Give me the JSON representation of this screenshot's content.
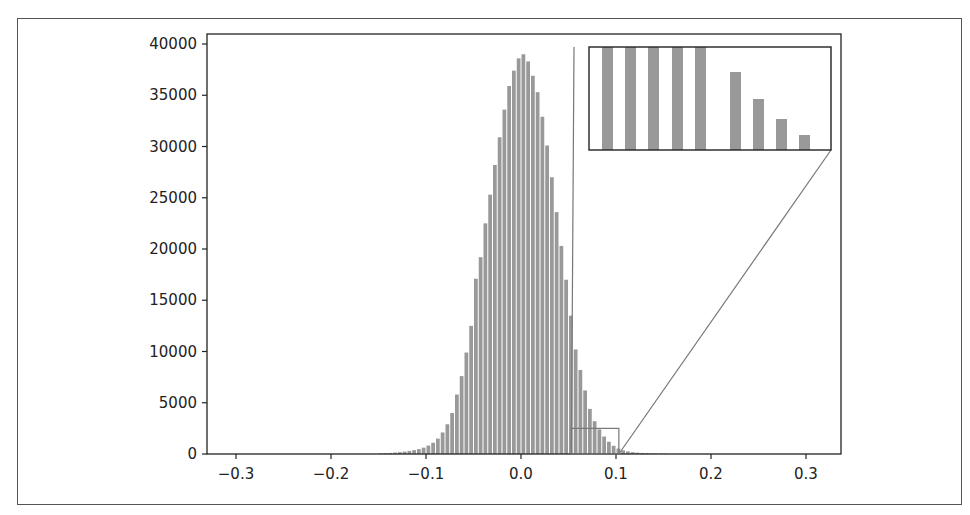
{
  "chart_data": {
    "type": "bar",
    "title": "",
    "xlabel": "",
    "ylabel": "",
    "xlim": [
      -0.33,
      0.335
    ],
    "ylim": [
      0,
      41000
    ],
    "grid": false,
    "legend": null,
    "bin_width": 0.005,
    "bar_color": "#999999",
    "x_ticks": [
      -0.3,
      -0.2,
      -0.1,
      0.0,
      0.1,
      0.2,
      0.3
    ],
    "x_tick_labels": [
      "-0.3",
      "-0.2",
      "-0.1",
      "0.0",
      "0.1",
      "0.2",
      "0.3"
    ],
    "y_ticks": [
      0,
      5000,
      10000,
      15000,
      20000,
      25000,
      30000,
      35000,
      40000
    ],
    "y_tick_labels": [
      "0",
      "5000",
      "10000",
      "15000",
      "20000",
      "25000",
      "30000",
      "35000",
      "40000"
    ],
    "bins_start": [
      -0.15,
      -0.145,
      -0.14,
      -0.135,
      -0.13,
      -0.125,
      -0.12,
      -0.115,
      -0.11,
      -0.105,
      -0.1,
      -0.095,
      -0.09,
      -0.085,
      -0.08,
      -0.075,
      -0.07,
      -0.065,
      -0.06,
      -0.055,
      -0.05,
      -0.045,
      -0.04,
      -0.035,
      -0.03,
      -0.025,
      -0.02,
      -0.015,
      -0.01,
      -0.005,
      0.0,
      0.005,
      0.01,
      0.015,
      0.02,
      0.025,
      0.03,
      0.035,
      0.04,
      0.045,
      0.05,
      0.055,
      0.06,
      0.065,
      0.07,
      0.075,
      0.08,
      0.085,
      0.09,
      0.095,
      0.1,
      0.105,
      0.11,
      0.115,
      0.12,
      0.125,
      0.13,
      0.135,
      0.14,
      0.145,
      0.15
    ],
    "values": [
      60,
      80,
      100,
      140,
      180,
      230,
      300,
      380,
      480,
      620,
      820,
      1100,
      1500,
      2100,
      2900,
      4000,
      5800,
      7600,
      9900,
      12500,
      17100,
      19200,
      22500,
      25300,
      28200,
      30900,
      33600,
      35900,
      37400,
      38600,
      39000,
      38300,
      36900,
      35300,
      32900,
      30100,
      27000,
      23600,
      20300,
      17000,
      13500,
      10200,
      8200,
      6200,
      4400,
      3200,
      2400,
      1700,
      1200,
      800,
      530,
      360,
      250,
      180,
      130,
      100,
      80,
      60,
      45,
      35,
      25
    ],
    "inset": {
      "description": "zoomed view of bins from ~0.05 to ~0.1",
      "source_xlim": [
        0.053,
        0.103
      ],
      "source_ylim": [
        0,
        2500
      ],
      "bars_visible": 9
    }
  }
}
